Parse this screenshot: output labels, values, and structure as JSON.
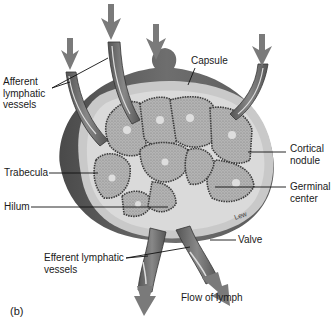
{
  "figure": {
    "panel_label": "(b)",
    "artist_signature": "Lew",
    "colors": {
      "arrow": "#7a7a7a",
      "capsule_dark": "#5a5a5a",
      "capsule_light": "#b8b8b8",
      "cortex": "#a9a9a9",
      "sinus_light": "#d6d6d6",
      "background": "#ffffff"
    }
  },
  "labels": {
    "afferent": "Afferent\nlymphatic\nvessels",
    "capsule": "Capsule",
    "cortical_nodule": "Cortical\nnodule",
    "trabecula": "Trabecula",
    "germinal_center": "Germinal\ncenter",
    "hilum": "Hilum",
    "valve": "Valve",
    "efferent": "Efferent lymphatic\nvessels",
    "flow": "Flow of lymph"
  }
}
